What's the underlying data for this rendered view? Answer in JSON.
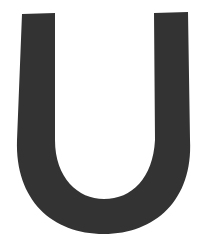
{
  "glyph": {
    "character": "U",
    "fill_color": "#333333",
    "background_color": "#ffffff"
  }
}
